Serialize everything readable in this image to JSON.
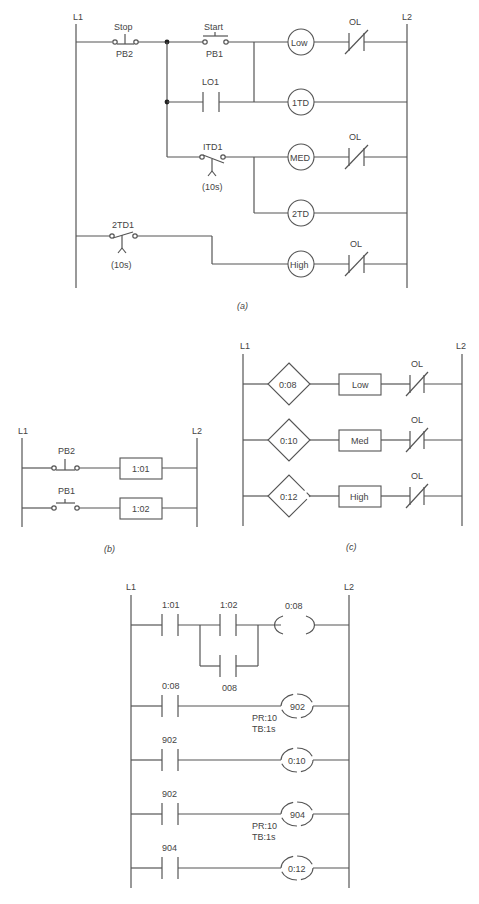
{
  "diagram_a": {
    "caption": "(a)",
    "rail_left": "L1",
    "rail_right": "L2",
    "stop_label": "Stop",
    "stop_tag": "PB2",
    "start_label": "Start",
    "start_tag": "PB1",
    "lo1_label": "LO1",
    "itd1_label": "ITD1",
    "itd1_time": "(10s)",
    "twotd1_label": "2TD1",
    "twotd1_time": "(10s)",
    "coil_low": "Low",
    "coil_1td": "1TD",
    "coil_med": "MED",
    "coil_2td": "2TD",
    "coil_high": "High",
    "ol_label": "OL"
  },
  "diagram_b": {
    "caption": "(b)",
    "rail_left": "L1",
    "rail_right": "L2",
    "pb2_label": "PB2",
    "pb1_label": "PB1",
    "out1": "1:01",
    "out2": "1:02"
  },
  "diagram_c": {
    "caption": "(c)",
    "rail_left": "L1",
    "rail_right": "L2",
    "rungs": [
      {
        "input": "0:08",
        "output": "Low",
        "ol": "OL"
      },
      {
        "input": "0:10",
        "output": "Med",
        "ol": "OL"
      },
      {
        "input": "0:12",
        "output": "High",
        "ol": "OL"
      }
    ]
  },
  "diagram_d": {
    "rail_left": "L1",
    "rail_right": "L2",
    "rung1": {
      "contact1": "1:01",
      "contact2": "1:02",
      "seal": "008",
      "coil": "0:08"
    },
    "rung2": {
      "contact": "0:08",
      "coil": "902",
      "preset": "PR:10",
      "timebase": "TB:1s"
    },
    "rung3": {
      "contact": "902",
      "coil": "0:10"
    },
    "rung4": {
      "contact": "902",
      "coil": "904",
      "preset": "PR:10",
      "timebase": "TB:1s"
    },
    "rung5": {
      "contact": "904",
      "coil": "0:12"
    }
  }
}
